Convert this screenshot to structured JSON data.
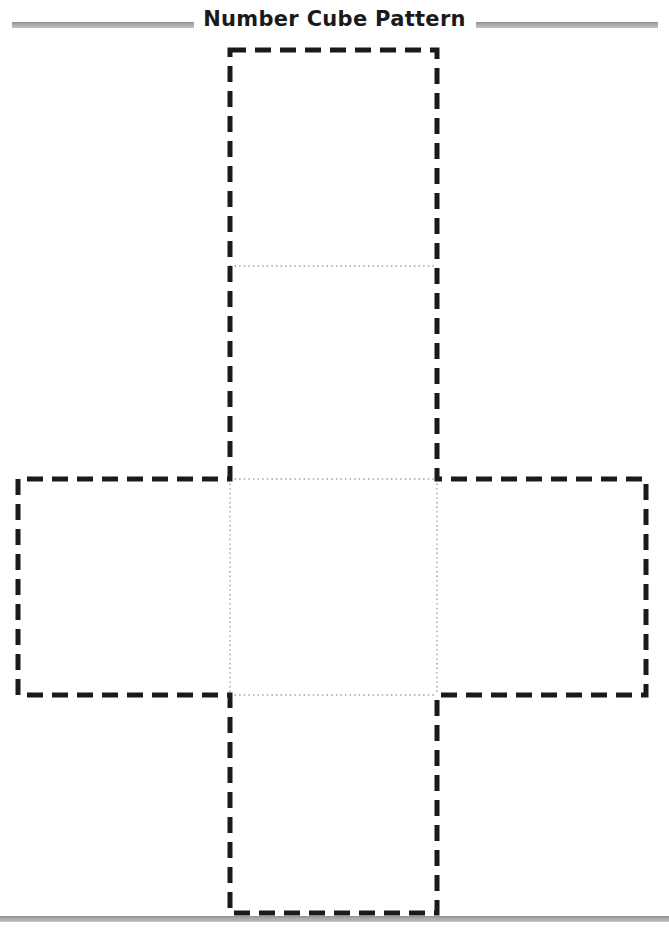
{
  "document": {
    "title": "Number Cube Pattern",
    "page_width": 669,
    "page_height": 927,
    "background_color": "#ffffff"
  },
  "header": {
    "title": "Number Cube Pattern",
    "rule_color": "#a8a8a8",
    "left_rule": {
      "x": 12,
      "y": 22,
      "width": 182,
      "height": 6
    },
    "right_rule": {
      "x": 476,
      "y": 22,
      "width": 182,
      "height": 6
    }
  },
  "footer": {
    "rule_color": "#a8a8a8",
    "rule": {
      "x": 0,
      "y": 916,
      "width": 669,
      "height": 6
    }
  },
  "diagram": {
    "name": "cube-net-pattern",
    "shape": "cross",
    "faces": 6,
    "cut_line": {
      "style": "dashed",
      "color": "#1a1a1a",
      "stroke_width": 5,
      "dash_length": 16,
      "gap_length": 9
    },
    "fold_line": {
      "style": "dotted",
      "color": "#9a9a9a",
      "stroke_width": 1.4,
      "dash_length": 1.4,
      "gap_length": 3.2
    },
    "grid": {
      "column_left_x": 230,
      "column_right_x": 437,
      "arm_left_x": 18,
      "arm_right_x": 646,
      "top_y": 50,
      "fold_upper_y": 266,
      "center_top_y": 479,
      "center_bottom_y": 695,
      "bottom_y": 913
    },
    "cut_outline_path": "M 230 50 L 437 50 L 437 479 L 646 479 L 646 695 L 437 695 L 437 913 L 230 913 L 230 695 L 18 695 L 18 479 L 230 479 Z",
    "fold_lines": [
      {
        "name": "fold-top-flap",
        "x1": 230,
        "y1": 266,
        "x2": 437,
        "y2": 266
      },
      {
        "name": "fold-center-top",
        "x1": 230,
        "y1": 479,
        "x2": 437,
        "y2": 479
      },
      {
        "name": "fold-center-bottom",
        "x1": 230,
        "y1": 695,
        "x2": 437,
        "y2": 695
      },
      {
        "name": "fold-center-left",
        "x1": 230,
        "y1": 479,
        "x2": 230,
        "y2": 695
      },
      {
        "name": "fold-center-right",
        "x1": 437,
        "y1": 479,
        "x2": 437,
        "y2": 695
      }
    ],
    "face_regions": [
      {
        "name": "face-top",
        "x": 230,
        "y": 50,
        "width": 207,
        "height": 216
      },
      {
        "name": "face-upper",
        "x": 230,
        "y": 266,
        "width": 207,
        "height": 213
      },
      {
        "name": "face-left",
        "x": 18,
        "y": 479,
        "width": 212,
        "height": 216
      },
      {
        "name": "face-center",
        "x": 230,
        "y": 479,
        "width": 207,
        "height": 216
      },
      {
        "name": "face-right",
        "x": 437,
        "y": 479,
        "width": 209,
        "height": 216
      },
      {
        "name": "face-bottom",
        "x": 230,
        "y": 695,
        "width": 207,
        "height": 218
      }
    ]
  }
}
